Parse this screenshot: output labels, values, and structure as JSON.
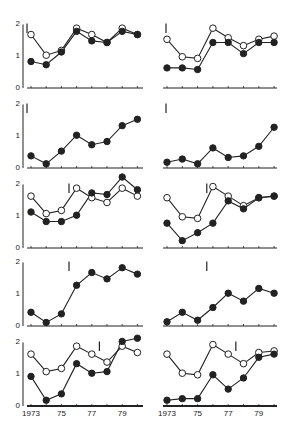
{
  "chart_data": {
    "type": "line",
    "layout": "5 rows x 2 columns of small-multiple line charts",
    "x": [
      1973,
      1974,
      1975,
      1976,
      1977,
      1978,
      1979,
      1980
    ],
    "x_tick_labels": [
      "1973",
      "75",
      "77",
      "79"
    ],
    "x_tick_label_positions": [
      1973,
      1975,
      1977,
      1979
    ],
    "y_tick_labels": [
      "0",
      "1",
      "2"
    ],
    "ylim": [
      0,
      2.2
    ],
    "grid": false,
    "legend": null,
    "title": "",
    "xlabel": "",
    "ylabel": "",
    "series_styles": {
      "open": {
        "marker": "open-circle",
        "color": "#222222"
      },
      "filled": {
        "marker": "filled-circle",
        "color": "#222222"
      }
    },
    "panels": [
      {
        "row": 0,
        "col": 0,
        "marker_x": 1972.9,
        "series": [
          {
            "name": "open",
            "values": [
              1.65,
              1.0,
              1.15,
              1.85,
              1.65,
              1.4,
              1.85,
              1.65
            ]
          },
          {
            "name": "filled",
            "values": [
              0.8,
              0.7,
              1.1,
              1.75,
              1.45,
              1.4,
              1.75,
              1.65
            ]
          }
        ]
      },
      {
        "row": 0,
        "col": 1,
        "marker_x": 1972.9,
        "series": [
          {
            "name": "open",
            "values": [
              1.5,
              0.95,
              0.9,
              1.85,
              1.55,
              1.3,
              1.5,
              1.6
            ]
          },
          {
            "name": "filled",
            "values": [
              0.6,
              0.6,
              0.55,
              1.4,
              1.4,
              1.05,
              1.4,
              1.4
            ]
          }
        ]
      },
      {
        "row": 1,
        "col": 0,
        "marker_x": 1972.9,
        "series": [
          {
            "name": "filled",
            "values": [
              0.35,
              0.1,
              0.5,
              1.0,
              0.7,
              0.8,
              1.3,
              1.5
            ]
          }
        ]
      },
      {
        "row": 1,
        "col": 1,
        "marker_x": 1972.9,
        "series": [
          {
            "name": "filled",
            "values": [
              0.15,
              0.25,
              0.1,
              0.6,
              0.3,
              0.35,
              0.65,
              1.25
            ]
          }
        ]
      },
      {
        "row": 2,
        "col": 0,
        "marker_x": 1975.5,
        "series": [
          {
            "name": "open",
            "values": [
              1.6,
              1.05,
              1.15,
              1.85,
              1.55,
              1.4,
              1.85,
              1.6
            ]
          },
          {
            "name": "filled",
            "values": [
              1.1,
              0.8,
              0.8,
              1.0,
              1.7,
              1.65,
              2.2,
              1.8
            ]
          }
        ]
      },
      {
        "row": 2,
        "col": 1,
        "marker_x": 1975.6,
        "series": [
          {
            "name": "open",
            "values": [
              1.55,
              0.95,
              0.9,
              1.9,
              1.6,
              1.3,
              1.55,
              1.6
            ]
          },
          {
            "name": "filled",
            "values": [
              0.75,
              0.2,
              0.45,
              0.75,
              1.45,
              1.2,
              1.55,
              1.6
            ]
          }
        ]
      },
      {
        "row": 3,
        "col": 0,
        "marker_x": 1975.5,
        "series": [
          {
            "name": "filled",
            "values": [
              0.4,
              0.08,
              0.35,
              1.25,
              1.65,
              1.45,
              1.8,
              1.6
            ]
          }
        ]
      },
      {
        "row": 3,
        "col": 1,
        "marker_x": 1975.6,
        "series": [
          {
            "name": "filled",
            "values": [
              0.1,
              0.4,
              0.15,
              0.55,
              1.0,
              0.75,
              1.15,
              1.0
            ]
          }
        ]
      },
      {
        "row": 4,
        "col": 0,
        "marker_x": 1977.5,
        "series": [
          {
            "name": "open",
            "values": [
              1.6,
              1.05,
              1.15,
              1.85,
              1.6,
              1.35,
              1.85,
              1.65
            ]
          },
          {
            "name": "filled",
            "values": [
              0.9,
              0.15,
              0.35,
              1.3,
              1.0,
              1.05,
              2.0,
              2.1
            ]
          }
        ]
      },
      {
        "row": 4,
        "col": 1,
        "marker_x": 1977.5,
        "series": [
          {
            "name": "open",
            "values": [
              1.6,
              1.0,
              0.95,
              1.9,
              1.6,
              1.3,
              1.65,
              1.7
            ]
          },
          {
            "name": "filled",
            "values": [
              0.15,
              0.2,
              0.2,
              0.95,
              0.5,
              0.85,
              1.5,
              1.6
            ]
          }
        ]
      }
    ]
  },
  "geometry": {
    "col_x0": [
      31,
      167
    ],
    "col_dx": [
      15.2,
      15.3
    ],
    "col_axis_x": [
      23,
      160
    ],
    "col_axis_end": [
      143,
      277
    ],
    "row_y0": [
      87,
      167,
      247,
      325,
      405
    ],
    "unit_px": 31.8,
    "left_col_has_y_labels": true,
    "bottom_row_has_x_labels": true
  }
}
